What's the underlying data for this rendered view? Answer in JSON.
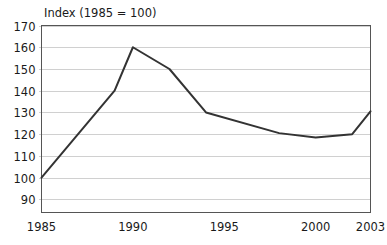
{
  "chart_data": {
    "type": "line",
    "title": "Index (1985 = 100)",
    "xlabel": "",
    "ylabel": "",
    "grid": "horizontal",
    "legend": "none",
    "xlim": [
      1985,
      2003
    ],
    "ylim": [
      84,
      170
    ],
    "y_ticks": [
      90,
      100,
      110,
      120,
      130,
      140,
      150,
      160,
      170
    ],
    "y_tick_labels": [
      "90",
      "100",
      "110",
      "120",
      "130",
      "140",
      "150",
      "160",
      "170"
    ],
    "x_ticks": [
      1985,
      1990,
      1995,
      2000,
      2003
    ],
    "x_tick_labels": [
      "1985",
      "1990",
      "1995",
      "2000",
      "2003"
    ],
    "series": [
      {
        "name": "Index",
        "color": "#333333",
        "x": [
          1985,
          1989,
          1990,
          1992,
          1994,
          1998,
          2000,
          2002,
          2003
        ],
        "values": [
          100,
          140,
          160,
          150,
          130,
          120.5,
          118.5,
          120,
          130.5
        ]
      }
    ]
  },
  "colors": {
    "line": "#333333",
    "gridline": "#d0d0d0",
    "axis": "#555555",
    "text": "#1a1a1a",
    "background": "#ffffff"
  }
}
